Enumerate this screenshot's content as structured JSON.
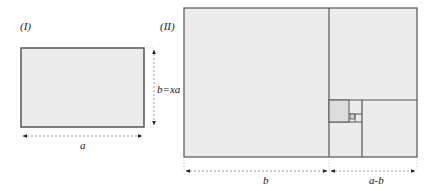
{
  "figure": {
    "panel_left": {
      "label": "(I)",
      "width_label": "a",
      "height_label": "b=xa"
    },
    "panel_right": {
      "label": "(II)",
      "left_width_label": "b",
      "right_width_label": "a-b"
    }
  },
  "colors": {
    "fill": "#ececec",
    "fill_dark": "#dcdcdc",
    "stroke": "#555555",
    "dim": "#777777"
  }
}
